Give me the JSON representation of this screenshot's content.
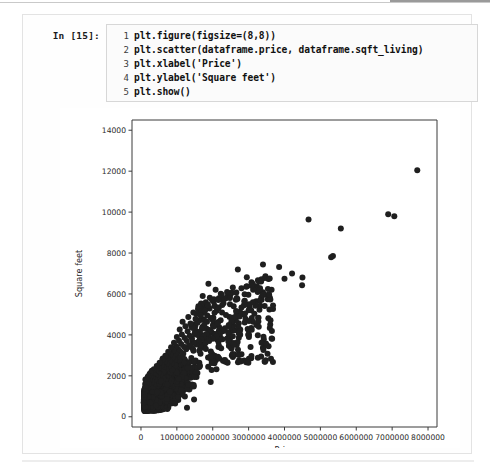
{
  "notebook": {
    "input_prompt": "In [15]:",
    "code_lines": [
      {
        "number": "1",
        "text": "plt.figure(figsize=(8,8))"
      },
      {
        "number": "2",
        "text": "plt.scatter(dataframe.price, dataframe.sqft_living)"
      },
      {
        "number": "3",
        "text": "plt.xlabel('Price')"
      },
      {
        "number": "4",
        "text": "plt.ylabel('Square feet')"
      },
      {
        "number": "5",
        "text": "plt.show()"
      }
    ]
  },
  "chart_data": {
    "type": "scatter",
    "title": "",
    "xlabel": "Price",
    "ylabel": "Square feet",
    "xlim": [
      -250000,
      8250000
    ],
    "ylim": [
      -500,
      14500
    ],
    "xticks": [
      0,
      1000000,
      2000000,
      3000000,
      4000000,
      5000000,
      6000000,
      7000000,
      8000000
    ],
    "xtick_labels": [
      "0",
      "1000000",
      "2000000",
      "3000000",
      "4000000",
      "5000000",
      "6000000",
      "7000000",
      "8000000"
    ],
    "yticks": [
      0,
      2000,
      4000,
      6000,
      8000,
      10000,
      12000,
      14000
    ],
    "ytick_labels": [
      "0",
      "2000",
      "4000",
      "6000",
      "8000",
      "10000",
      "12000",
      "14000"
    ],
    "grid": false,
    "legend": null,
    "marker_color": "#1f1f1f",
    "marker_size": 3.0,
    "series": [
      {
        "name": "sqft_living vs price",
        "note": "Dense housing scatter: large cluster below ~1.5M price and under ~5000 sqft, with sparse high-price/high-sqft outliers.",
        "points": [
          [
            7700000,
            12050
          ],
          [
            6890000,
            9890
          ],
          [
            7060000,
            9800
          ],
          [
            5570000,
            9200
          ],
          [
            5350000,
            7850
          ],
          [
            5300000,
            7800
          ],
          [
            4670000,
            9640
          ],
          [
            4500000,
            6800
          ],
          [
            4490000,
            6430
          ],
          [
            4210000,
            7000
          ],
          [
            4000000,
            6740
          ],
          [
            3850000,
            7320
          ],
          [
            3640000,
            6210
          ],
          [
            3570000,
            5990
          ],
          [
            3400000,
            7440
          ],
          [
            3300000,
            6190
          ],
          [
            3200000,
            5490
          ],
          [
            3120000,
            5600
          ],
          [
            3075000,
            6400
          ],
          [
            3000000,
            5200
          ],
          [
            2950000,
            6820
          ],
          [
            2900000,
            5050
          ],
          [
            2880000,
            5640
          ],
          [
            2800000,
            6280
          ],
          [
            2750000,
            4900
          ],
          [
            2700000,
            7200
          ],
          [
            2650000,
            5170
          ],
          [
            2600000,
            4860
          ],
          [
            2560000,
            6310
          ],
          [
            2520000,
            4660
          ],
          [
            2480000,
            5800
          ],
          [
            2450000,
            4480
          ],
          [
            2400000,
            6100
          ],
          [
            2370000,
            4970
          ],
          [
            2340000,
            4320
          ],
          [
            2300000,
            5550
          ],
          [
            2280000,
            4180
          ],
          [
            2250000,
            5960
          ],
          [
            2220000,
            4720
          ],
          [
            2200000,
            4060
          ],
          [
            2160000,
            5300
          ],
          [
            2130000,
            4540
          ],
          [
            2100000,
            3920
          ],
          [
            2080000,
            6200
          ],
          [
            2050000,
            5080
          ],
          [
            2020000,
            4400
          ],
          [
            2000000,
            3810
          ],
          [
            1980000,
            5710
          ],
          [
            1950000,
            4820
          ],
          [
            1930000,
            4220
          ],
          [
            1900000,
            3700
          ],
          [
            1880000,
            6500
          ],
          [
            1860000,
            5420
          ],
          [
            1840000,
            4640
          ],
          [
            1820000,
            4050
          ],
          [
            1800000,
            3600
          ],
          [
            1780000,
            5180
          ],
          [
            1760000,
            4480
          ],
          [
            1740000,
            3920
          ],
          [
            1720000,
            5900
          ],
          [
            1700000,
            4300
          ],
          [
            1680000,
            3790
          ],
          [
            1660000,
            4950
          ],
          [
            1640000,
            4150
          ],
          [
            1620000,
            3660
          ],
          [
            1600000,
            5400
          ],
          [
            1580000,
            4600
          ],
          [
            1560000,
            4010
          ],
          [
            1540000,
            3530
          ],
          [
            1520000,
            4780
          ],
          [
            1500000,
            4100
          ],
          [
            1480000,
            3620
          ],
          [
            1460000,
            5100
          ],
          [
            1440000,
            4350
          ],
          [
            1420000,
            3840
          ],
          [
            1400000,
            3400
          ],
          [
            1380000,
            4560
          ],
          [
            1360000,
            3960
          ],
          [
            1340000,
            3500
          ],
          [
            1320000,
            4880
          ],
          [
            1300000,
            4180
          ],
          [
            1280000,
            3700
          ],
          [
            1260000,
            3300
          ],
          [
            1240000,
            4420
          ],
          [
            1220000,
            3850
          ],
          [
            1200000,
            3420
          ],
          [
            1180000,
            3080
          ],
          [
            1160000,
            4640
          ],
          [
            1140000,
            4020
          ],
          [
            1120000,
            3560
          ],
          [
            1100000,
            3180
          ],
          [
            1080000,
            4260
          ],
          [
            1060000,
            3720
          ],
          [
            1040000,
            3300
          ],
          [
            1020000,
            2960
          ],
          [
            1000000,
            3900
          ],
          [
            980000,
            3450
          ],
          [
            960000,
            3080
          ],
          [
            940000,
            2780
          ],
          [
            920000,
            3620
          ],
          [
            900000,
            3220
          ],
          [
            880000,
            2880
          ],
          [
            860000,
            2600
          ],
          [
            840000,
            3400
          ],
          [
            820000,
            3040
          ],
          [
            800000,
            2720
          ],
          [
            780000,
            2460
          ],
          [
            760000,
            3180
          ],
          [
            740000,
            2860
          ],
          [
            720000,
            2560
          ],
          [
            700000,
            2320
          ],
          [
            680000,
            2980
          ],
          [
            660000,
            2680
          ],
          [
            640000,
            2400
          ],
          [
            620000,
            2180
          ],
          [
            600000,
            2800
          ],
          [
            580000,
            2520
          ],
          [
            560000,
            2260
          ],
          [
            540000,
            2060
          ],
          [
            520000,
            2640
          ],
          [
            500000,
            2380
          ],
          [
            480000,
            2140
          ],
          [
            460000,
            1940
          ],
          [
            440000,
            2480
          ],
          [
            420000,
            2240
          ],
          [
            400000,
            2010
          ],
          [
            380000,
            1820
          ],
          [
            360000,
            2320
          ],
          [
            340000,
            2100
          ],
          [
            320000,
            1890
          ],
          [
            300000,
            1700
          ],
          [
            280000,
            2160
          ],
          [
            260000,
            1960
          ],
          [
            240000,
            1760
          ],
          [
            220000,
            1590
          ],
          [
            200000,
            1980
          ],
          [
            180000,
            1780
          ],
          [
            160000,
            1600
          ],
          [
            140000,
            1430
          ],
          [
            120000,
            1250
          ],
          [
            100000,
            1080
          ],
          [
            90000,
            930
          ],
          [
            80000,
            820
          ],
          [
            75000,
            700
          ]
        ]
      }
    ]
  }
}
